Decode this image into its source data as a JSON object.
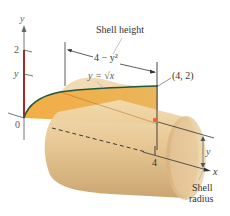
{
  "figure": {
    "axes": {
      "y_axis_label": "y",
      "x_axis_label": "x",
      "origin_label": "0",
      "y_ticks": [
        {
          "label": "2",
          "value": 2
        },
        {
          "label": "y",
          "value": "y"
        }
      ],
      "x_ticks": [
        {
          "label": "4",
          "value": 4
        }
      ]
    },
    "curve": {
      "equation_label": "y = √x"
    },
    "annotations": {
      "shell_height_label": "Shell height",
      "shell_height_expr": "4 − y²",
      "point_label": "(4, 2)",
      "radius_label": "y",
      "shell_radius_line1": "Shell",
      "shell_radius_line2": "radius"
    },
    "colors": {
      "region_fill": "#f0b04a",
      "shell_fill": "#e3c48f",
      "shell_rim": "#d9b27a",
      "curve": "#1f5a3a",
      "y_axis_highlight": "#a8262a",
      "point": "#e8663a",
      "axis": "#555555"
    }
  }
}
